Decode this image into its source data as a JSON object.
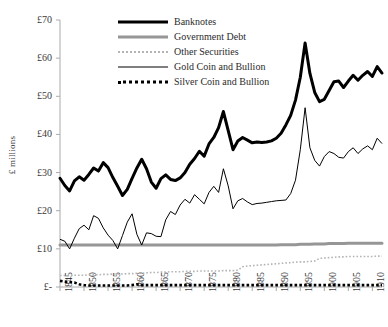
{
  "chart": {
    "ylabel": "£ millions",
    "yticks": [
      "£70",
      "£60",
      "£50",
      "£40",
      "£30",
      "£20",
      "£10",
      "£-"
    ],
    "xticks": [
      "1845",
      "1850",
      "1855",
      "1860",
      "1865",
      "1870",
      "1875",
      "1880",
      "1885",
      "1890",
      "1895",
      "1900",
      "1905",
      "1910"
    ],
    "legend": [
      {
        "label": "Banknotes",
        "key": "banknotes",
        "color": "#000000",
        "style": "thick-solid"
      },
      {
        "label": "Government Debt",
        "key": "government_debt",
        "color": "#969696",
        "style": "thick-solid"
      },
      {
        "label": "Other Securities",
        "key": "other_securities",
        "color": "#b4b4b4",
        "style": "fine-dotted"
      },
      {
        "label": "Gold Coin and Bullion",
        "key": "gold_coin_and_bullion",
        "color": "#000000",
        "style": "thin-solid"
      },
      {
        "label": "Silver Coin and Bullion",
        "key": "silver_coin_and_bullion",
        "color": "#000000",
        "style": "bold-dotted"
      }
    ]
  },
  "chart_data": {
    "type": "line",
    "title": "",
    "xlabel": "",
    "ylabel": "£ millions",
    "xlim": [
      1845,
      1912
    ],
    "ylim": [
      0,
      70
    ],
    "grid": false,
    "legend_position": "top-center",
    "x": [
      1845,
      1846,
      1847,
      1848,
      1849,
      1850,
      1851,
      1852,
      1853,
      1854,
      1855,
      1856,
      1857,
      1858,
      1859,
      1860,
      1861,
      1862,
      1863,
      1864,
      1865,
      1866,
      1867,
      1868,
      1869,
      1870,
      1871,
      1872,
      1873,
      1874,
      1875,
      1876,
      1877,
      1878,
      1879,
      1880,
      1881,
      1882,
      1883,
      1884,
      1885,
      1886,
      1887,
      1888,
      1889,
      1890,
      1891,
      1892,
      1893,
      1894,
      1895,
      1896,
      1897,
      1898,
      1899,
      1900,
      1901,
      1902,
      1903,
      1904,
      1905,
      1906,
      1907,
      1908,
      1909,
      1910,
      1911,
      1912
    ],
    "series": [
      {
        "name": "Banknotes",
        "color": "#000000",
        "style": "thick-solid",
        "values": [
          28.5,
          26.6,
          25.2,
          27.8,
          28.9,
          28.0,
          29.5,
          31.2,
          30.4,
          32.6,
          31.3,
          28.7,
          26.4,
          24.0,
          25.6,
          28.5,
          31.2,
          33.5,
          31.0,
          27.5,
          25.9,
          28.4,
          29.4,
          28.2,
          27.9,
          28.6,
          30.0,
          32.2,
          33.7,
          35.6,
          34.3,
          37.5,
          39.2,
          41.8,
          46.0,
          41.0,
          36.0,
          38.3,
          39.2,
          38.5,
          37.8,
          38.0,
          37.9,
          38.0,
          38.3,
          39.0,
          40.3,
          42.5,
          45.0,
          49.0,
          55.0,
          64.0,
          56.0,
          51.0,
          48.6,
          49.2,
          51.5,
          53.8,
          54.0,
          52.3,
          54.0,
          55.5,
          54.2,
          55.5,
          56.5,
          55.2,
          57.8,
          56.1
        ]
      },
      {
        "name": "Government Debt",
        "color": "#969696",
        "style": "thick-solid",
        "values": [
          11.0,
          11.0,
          11.0,
          11.0,
          11.0,
          11.0,
          11.0,
          11.0,
          11.0,
          11.0,
          11.0,
          11.0,
          11.0,
          11.0,
          11.0,
          11.0,
          11.0,
          11.0,
          11.0,
          11.0,
          11.0,
          11.0,
          11.0,
          11.0,
          11.0,
          11.0,
          11.0,
          11.0,
          11.0,
          11.0,
          11.0,
          11.0,
          11.0,
          11.0,
          11.0,
          11.0,
          11.0,
          11.0,
          11.0,
          11.0,
          11.0,
          11.0,
          11.0,
          11.0,
          11.0,
          11.0,
          11.1,
          11.1,
          11.1,
          11.1,
          11.2,
          11.2,
          11.2,
          11.3,
          11.3,
          11.3,
          11.4,
          11.4,
          11.4,
          11.4,
          11.5,
          11.5,
          11.5,
          11.5,
          11.5,
          11.5,
          11.5,
          11.5
        ]
      },
      {
        "name": "Other Securities",
        "color": "#b4b4b4",
        "style": "fine-dotted",
        "values": [
          3.0,
          3.0,
          3.0,
          3.1,
          3.1,
          3.1,
          3.2,
          3.2,
          3.2,
          3.3,
          3.3,
          3.4,
          3.4,
          3.4,
          3.5,
          3.5,
          3.6,
          3.6,
          3.7,
          3.8,
          3.8,
          3.9,
          3.9,
          4.0,
          4.0,
          4.0,
          4.1,
          4.1,
          4.1,
          4.2,
          4.2,
          4.2,
          4.2,
          4.2,
          4.3,
          4.3,
          4.3,
          4.4,
          5.3,
          5.5,
          5.6,
          5.7,
          5.8,
          5.9,
          6.0,
          6.1,
          6.2,
          6.3,
          6.4,
          6.5,
          6.6,
          6.6,
          6.7,
          6.8,
          7.5,
          7.6,
          7.7,
          7.8,
          7.9,
          7.9,
          8.0,
          8.0,
          8.0,
          8.0,
          8.0,
          8.0,
          8.1,
          8.1
        ]
      },
      {
        "name": "Gold Coin and Bullion",
        "color": "#000000",
        "style": "thin-solid",
        "values": [
          12.5,
          12.0,
          10.0,
          12.8,
          15.3,
          16.2,
          15.0,
          18.7,
          18.0,
          15.5,
          13.6,
          12.2,
          10.0,
          13.5,
          17.0,
          19.2,
          13.8,
          11.0,
          14.2,
          14.0,
          13.3,
          13.2,
          17.6,
          19.8,
          19.0,
          21.5,
          23.0,
          22.0,
          24.2,
          23.0,
          21.8,
          24.8,
          26.4,
          24.8,
          31.0,
          26.5,
          20.5,
          22.6,
          23.2,
          22.3,
          21.6,
          21.9,
          22.0,
          22.2,
          22.4,
          22.6,
          22.7,
          22.8,
          24.5,
          28.0,
          36.0,
          47.0,
          36.5,
          33.2,
          31.7,
          34.2,
          35.5,
          35.0,
          34.0,
          33.8,
          35.5,
          36.5,
          35.0,
          36.2,
          37.0,
          36.0,
          39.0,
          37.6
        ]
      },
      {
        "name": "Silver Coin and Bullion",
        "color": "#000000",
        "style": "bold-dotted",
        "values": [
          1.6,
          1.4,
          1.3,
          1.2,
          0.7,
          0.5,
          0.4,
          0.4,
          0.4,
          0.4,
          0.4,
          0.4,
          0.4,
          0.4,
          0.4,
          0.5,
          0.7,
          0.5,
          0.5,
          0.5,
          0.5,
          0.5,
          0.5,
          0.5,
          0.5,
          0.5,
          0.5,
          0.5,
          0.5,
          0.5,
          0.5,
          0.5,
          0.5,
          0.5,
          0.5,
          0.5,
          0.5,
          0.5,
          0.5,
          0.5,
          0.5,
          0.5,
          0.5,
          0.5,
          0.5,
          0.5,
          0.5,
          0.5,
          0.5,
          0.5,
          0.5,
          0.5,
          0.5,
          0.5,
          0.5,
          0.5,
          0.5,
          0.5,
          0.5,
          0.5,
          0.5,
          0.5,
          0.5,
          0.5,
          0.5,
          0.5,
          0.5,
          0.5
        ]
      }
    ]
  }
}
